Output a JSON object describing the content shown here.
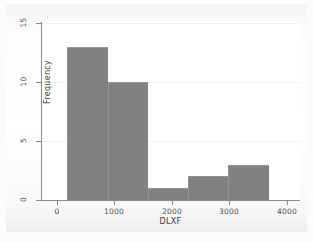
{
  "figure": {
    "background_color": "#fbfbfb",
    "plot_background_color": "#ffffff",
    "bar_color": "#818181",
    "axis_color": "#8a8a8a",
    "grid_color": "#f0f0f0"
  },
  "chart_data": {
    "type": "bar",
    "title": "",
    "xlabel": "DLXF",
    "ylabel": "Frequency",
    "xlim": [
      -120,
      4000
    ],
    "ylim": [
      0,
      15
    ],
    "grid": true,
    "legend": null,
    "xticks": [
      "0",
      "1000",
      "2000",
      "3000",
      "4000"
    ],
    "xtick_values": [
      0,
      1000,
      2000,
      3000,
      4000
    ],
    "yticks": [
      "0",
      "5",
      "10",
      "15"
    ],
    "ytick_values": [
      0,
      5,
      10,
      15
    ],
    "bin_edges": [
      180,
      880,
      1580,
      2280,
      2980,
      3680
    ],
    "categories": [
      "180-880",
      "880-1580",
      "1580-2280",
      "2280-2980",
      "2980-3680"
    ],
    "values": [
      13,
      10,
      1,
      2,
      3
    ],
    "bars": [
      {
        "label": "180-880",
        "x0": 180,
        "x1": 880,
        "value": 13
      },
      {
        "label": "880-1580",
        "x0": 880,
        "x1": 1580,
        "value": 10
      },
      {
        "label": "1580-2280",
        "x0": 1580,
        "x1": 2280,
        "value": 1
      },
      {
        "label": "2280-2980",
        "x0": 2280,
        "x1": 2980,
        "value": 2
      },
      {
        "label": "2980-3680",
        "x0": 2980,
        "x1": 3680,
        "value": 3
      }
    ]
  }
}
